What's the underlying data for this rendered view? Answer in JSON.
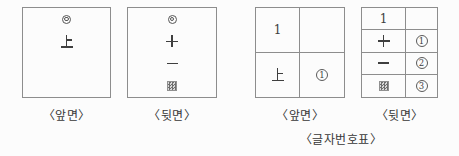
{
  "figure": {
    "caption": "〈글자번호표〉"
  },
  "front_card": {
    "label": "〈앞면〉",
    "mark": "◎",
    "character": "上"
  },
  "back_card": {
    "label": "〈뒷면〉",
    "mark": "◎",
    "stroke_cross": "十",
    "stroke_dash": "一",
    "shaded_square": "▨"
  },
  "front_table": {
    "label": "〈앞면〉",
    "top_left": "1",
    "top_right": "",
    "bottom_left": "上",
    "bottom_right": "①",
    "bottom_right_digit": "1"
  },
  "back_table": {
    "label": "〈뒷면〉",
    "header_left": "1",
    "header_right": "",
    "rows": [
      {
        "symbol": "十",
        "number": "①",
        "digit": "1"
      },
      {
        "symbol": "一",
        "number": "②",
        "digit": "2"
      },
      {
        "symbol": "▨",
        "number": "③",
        "digit": "3"
      }
    ]
  },
  "colors": {
    "line": "#8d8d8d",
    "ink": "#3f3f3f",
    "background": "#fcfcfc"
  }
}
